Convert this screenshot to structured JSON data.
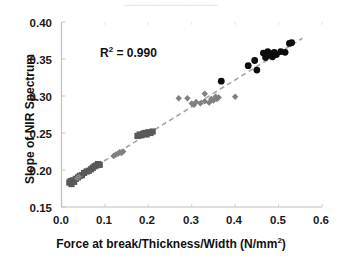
{
  "ghost_text": "............................................",
  "axes": {
    "x_title_main": "Force at break/Thickness/Width (N/mm",
    "x_title_sup": "2",
    "x_title_tail": ")",
    "y_title": "Slope of NIR Spectrum",
    "x_ticks": [
      "0.0",
      "0.1",
      "0.2",
      "0.3",
      "0.4",
      "0.5",
      "0.6"
    ],
    "y_ticks": [
      "0.40",
      "0.35",
      "0.30",
      "0.25",
      "0.20",
      "0.15"
    ]
  },
  "annotation": {
    "r2_prefix": "R",
    "r2_sup": "2",
    "r2_value": " = 0.990"
  },
  "colors": {
    "square_marker": "#595959",
    "diamond_marker": "#808080",
    "circle_marker": "#0d0d0d",
    "trendline": "#a6a6a6",
    "axis": "#bfbfbf",
    "text": "#111111",
    "background": "#ffffff"
  },
  "chart_data": {
    "type": "scatter",
    "title": "",
    "xlabel": "Force at break/Thickness/Width (N/mm2)",
    "ylabel": "Slope of NIR Spectrum",
    "xlim": [
      0.0,
      0.6
    ],
    "ylim": [
      0.15,
      0.4
    ],
    "xticks": [
      0.0,
      0.1,
      0.2,
      0.3,
      0.4,
      0.5,
      0.6
    ],
    "yticks": [
      0.15,
      0.2,
      0.25,
      0.3,
      0.35,
      0.4
    ],
    "grid": false,
    "legend": "none",
    "annotations": [
      {
        "text": "R2 = 0.990",
        "x": 0.1,
        "y": 0.352
      }
    ],
    "trendline": {
      "style": "dashed",
      "color": "#a6a6a6",
      "x_start": 0.015,
      "y_start": 0.182,
      "x_end": 0.555,
      "y_end": 0.378
    },
    "series": [
      {
        "name": "Group A",
        "marker": "square",
        "color": "#595959",
        "points": [
          [
            0.018,
            0.183
          ],
          [
            0.021,
            0.185
          ],
          [
            0.023,
            0.181
          ],
          [
            0.026,
            0.186
          ],
          [
            0.029,
            0.184
          ],
          [
            0.033,
            0.188
          ],
          [
            0.038,
            0.19
          ],
          [
            0.042,
            0.192
          ],
          [
            0.047,
            0.193
          ],
          [
            0.052,
            0.196
          ],
          [
            0.058,
            0.198
          ],
          [
            0.063,
            0.199
          ],
          [
            0.068,
            0.201
          ],
          [
            0.072,
            0.203
          ],
          [
            0.076,
            0.205
          ],
          [
            0.08,
            0.206
          ],
          [
            0.084,
            0.208
          ],
          [
            0.088,
            0.207
          ],
          [
            0.175,
            0.246
          ],
          [
            0.18,
            0.248
          ],
          [
            0.184,
            0.247
          ],
          [
            0.188,
            0.249
          ],
          [
            0.192,
            0.25
          ],
          [
            0.196,
            0.248
          ],
          [
            0.2,
            0.251
          ],
          [
            0.205,
            0.25
          ],
          [
            0.21,
            0.252
          ]
        ]
      },
      {
        "name": "Group B",
        "marker": "diamond",
        "color": "#808080",
        "points": [
          [
            0.036,
            0.189
          ],
          [
            0.04,
            0.191
          ],
          [
            0.12,
            0.219
          ],
          [
            0.125,
            0.221
          ],
          [
            0.13,
            0.222
          ],
          [
            0.134,
            0.224
          ],
          [
            0.138,
            0.223
          ],
          [
            0.142,
            0.225
          ],
          [
            0.27,
            0.297
          ],
          [
            0.29,
            0.297
          ],
          [
            0.3,
            0.29
          ],
          [
            0.305,
            0.288
          ],
          [
            0.31,
            0.292
          ],
          [
            0.32,
            0.29
          ],
          [
            0.33,
            0.293
          ],
          [
            0.34,
            0.291
          ],
          [
            0.345,
            0.296
          ],
          [
            0.35,
            0.294
          ],
          [
            0.355,
            0.299
          ],
          [
            0.358,
            0.296
          ],
          [
            0.362,
            0.298
          ],
          [
            0.33,
            0.303
          ],
          [
            0.4,
            0.299
          ]
        ]
      },
      {
        "name": "Group C",
        "marker": "circle",
        "color": "#0d0d0d",
        "points": [
          [
            0.368,
            0.32
          ],
          [
            0.43,
            0.341
          ],
          [
            0.445,
            0.348
          ],
          [
            0.45,
            0.335
          ],
          [
            0.465,
            0.358
          ],
          [
            0.47,
            0.352
          ],
          [
            0.475,
            0.36
          ],
          [
            0.478,
            0.355
          ],
          [
            0.482,
            0.357
          ],
          [
            0.486,
            0.353
          ],
          [
            0.49,
            0.359
          ],
          [
            0.495,
            0.356
          ],
          [
            0.505,
            0.36
          ],
          [
            0.515,
            0.359
          ],
          [
            0.525,
            0.371
          ],
          [
            0.53,
            0.372
          ]
        ]
      }
    ]
  }
}
